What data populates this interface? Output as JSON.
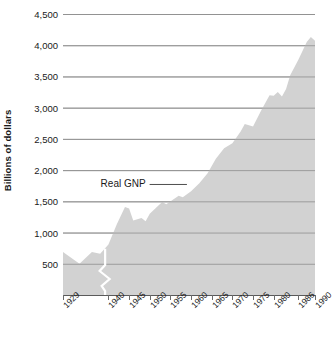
{
  "chart_data": {
    "type": "area",
    "title": "",
    "xlabel": "",
    "ylabel": "Billions of dollars",
    "ylim": [
      0,
      4500
    ],
    "xlim": [
      1929,
      1990
    ],
    "grid": true,
    "legend_position": "inline-annotation",
    "series_label": "Real GNP",
    "area_color": "#d2d2d2",
    "grid_color": "#9a9a9a",
    "axis_color": "#5a5a5a",
    "text_color": "#1a1a1a",
    "y_ticks": [
      "4,500",
      "4,000",
      "3,500",
      "3,000",
      "2,500",
      "2,000",
      "1,500",
      "1,000",
      "500"
    ],
    "y_tick_values": [
      4500,
      4000,
      3500,
      3000,
      2500,
      2000,
      1500,
      1000,
      500
    ],
    "x_ticks": [
      "1929",
      "1940",
      "1945",
      "1950",
      "1955",
      "1960",
      "1965",
      "1970",
      "1975",
      "1980",
      "1986",
      "1990"
    ],
    "x_tick_values": [
      1929,
      1940,
      1945,
      1950,
      1955,
      1960,
      1965,
      1970,
      1975,
      1980,
      1986,
      1990
    ],
    "axis_break": true,
    "annotations": [
      {
        "text": "Real GNP",
        "x": 1949,
        "y": 1770,
        "leader_to_x": 1959
      }
    ],
    "x": [
      1929,
      1930,
      1931,
      1932,
      1933,
      1934,
      1935,
      1936,
      1937,
      1938,
      1939,
      1940,
      1941,
      1942,
      1943,
      1944,
      1945,
      1946,
      1947,
      1948,
      1949,
      1950,
      1951,
      1952,
      1953,
      1954,
      1955,
      1956,
      1957,
      1958,
      1959,
      1960,
      1961,
      1962,
      1963,
      1964,
      1965,
      1966,
      1967,
      1968,
      1969,
      1970,
      1971,
      1972,
      1973,
      1974,
      1975,
      1976,
      1977,
      1978,
      1979,
      1980,
      1981,
      1982,
      1983,
      1984,
      1985,
      1986,
      1987,
      1988,
      1989,
      1990
    ],
    "values": [
      690,
      630,
      590,
      510,
      500,
      555,
      605,
      685,
      720,
      690,
      745,
      810,
      950,
      1130,
      1320,
      1415,
      1400,
      1240,
      1230,
      1280,
      1270,
      1385,
      1495,
      1550,
      1620,
      1610,
      1720,
      1755,
      1790,
      1775,
      1890,
      1935,
      1985,
      2105,
      2195,
      2320,
      2465,
      2620,
      2690,
      2820,
      2910,
      2910,
      3000,
      3160,
      3340,
      3320,
      3280,
      3460,
      3620,
      3810,
      3930,
      3920,
      4010,
      3930,
      4090,
      4380,
      4560,
      4700,
      4870,
      5070,
      5250,
      5350
    ],
    "values_note": "Real GNP in billions of dollars, 1929-1990"
  },
  "series_points_plotted": {
    "note": "Rendered outline follows these (year, value) vertices",
    "vertices": [
      [
        1929,
        690
      ],
      [
        1933,
        500
      ],
      [
        1936,
        690
      ],
      [
        1938,
        660
      ],
      [
        1940,
        810
      ],
      [
        1942,
        1130
      ],
      [
        1944,
        1410
      ],
      [
        1945,
        1385
      ],
      [
        1946,
        1195
      ],
      [
        1948,
        1235
      ],
      [
        1949,
        1180
      ],
      [
        1950,
        1300
      ],
      [
        1953,
        1490
      ],
      [
        1954,
        1455
      ],
      [
        1957,
        1590
      ],
      [
        1958,
        1565
      ],
      [
        1960,
        1660
      ],
      [
        1962,
        1790
      ],
      [
        1964,
        1950
      ],
      [
        1966,
        2180
      ],
      [
        1968,
        2350
      ],
      [
        1970,
        2430
      ],
      [
        1972,
        2620
      ],
      [
        1973,
        2740
      ],
      [
        1975,
        2700
      ],
      [
        1977,
        2960
      ],
      [
        1979,
        3200
      ],
      [
        1980,
        3190
      ],
      [
        1981,
        3250
      ],
      [
        1982,
        3180
      ],
      [
        1983,
        3300
      ],
      [
        1984,
        3520
      ],
      [
        1986,
        3770
      ],
      [
        1988,
        4050
      ],
      [
        1989,
        4130
      ],
      [
        1990,
        4070
      ]
    ]
  }
}
